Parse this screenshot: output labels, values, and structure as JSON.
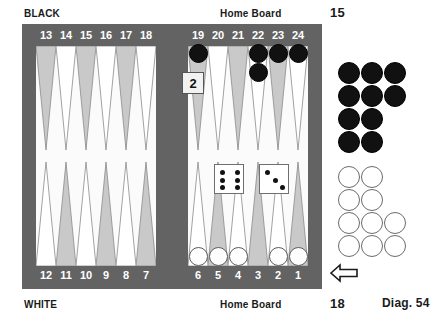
{
  "diagram": {
    "caption": "Diag. 54",
    "top_player_label": "BLACK",
    "bottom_player_label": "WHITE",
    "home_board_label_top": "Home Board",
    "home_board_label_bottom": "Home Board",
    "pip_count_black": "15",
    "pip_count_white": "18"
  },
  "colors": {
    "frame": "#636363",
    "field": "#fbfbfb",
    "point_shaded": "#c9c9c9",
    "point_plain": "#ffffff",
    "point_outline": "#8a8a8a",
    "black_checker": "#111111",
    "white_checker": "#ffffff",
    "number_text": "#ffffff",
    "caption_text": "#1a1a1a"
  },
  "board": {
    "point_numbers_top": [
      "13",
      "14",
      "15",
      "16",
      "17",
      "18",
      "19",
      "20",
      "21",
      "22",
      "23",
      "24"
    ],
    "point_numbers_bottom": [
      "12",
      "11",
      "10",
      "9",
      "8",
      "7",
      "6",
      "5",
      "4",
      "3",
      "2",
      "1"
    ],
    "top_left_quadrant_points": [
      "13",
      "14",
      "15",
      "16",
      "17",
      "18"
    ],
    "top_right_quadrant_points": [
      "19",
      "20",
      "21",
      "22",
      "23",
      "24"
    ],
    "bottom_left_quadrant_points": [
      "12",
      "11",
      "10",
      "9",
      "8",
      "7"
    ],
    "bottom_right_quadrant_points": [
      "6",
      "5",
      "4",
      "3",
      "2",
      "1"
    ],
    "checkers": [
      {
        "point": "19",
        "color": "black",
        "count": 1
      },
      {
        "point": "22",
        "color": "black",
        "count": 2
      },
      {
        "point": "23",
        "color": "black",
        "count": 1
      },
      {
        "point": "24",
        "color": "black",
        "count": 1
      },
      {
        "point": "6",
        "color": "white",
        "count": 1
      },
      {
        "point": "5",
        "color": "white",
        "count": 1
      },
      {
        "point": "4",
        "color": "white",
        "count": 1
      },
      {
        "point": "2",
        "color": "white",
        "count": 1
      },
      {
        "point": "1",
        "color": "white",
        "count": 1
      }
    ],
    "on_board_black_count": 5,
    "on_board_white_count": 5
  },
  "off_board": {
    "black_borne_off": 10,
    "white_borne_off": 10,
    "black_rows": [
      3,
      3,
      2,
      2
    ],
    "white_rows": [
      2,
      2,
      3,
      3
    ]
  },
  "dice": {
    "die_one_value": 6,
    "die_two_value": 3,
    "roll_text": "6-3"
  },
  "doubling_cube": {
    "value": "2"
  },
  "arrow": {
    "direction": "left"
  }
}
